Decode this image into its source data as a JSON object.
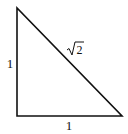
{
  "diagram": {
    "type": "right-triangle",
    "stroke_color": "#111111",
    "background": "#ffffff",
    "vertices": {
      "top": [
        17,
        8
      ],
      "bottom_left": [
        17,
        116
      ],
      "bottom_right": [
        122,
        116
      ]
    },
    "labels": {
      "left_side": "1",
      "bottom_side": "1",
      "hypotenuse_radicand": "2"
    }
  }
}
